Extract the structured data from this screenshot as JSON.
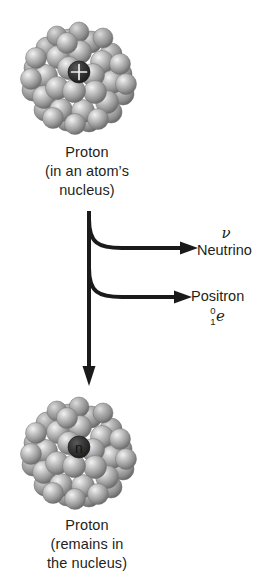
{
  "diagram": {
    "background_color": "#ffffff",
    "ink_color": "#231f20",
    "nucleon_color": "#9a9a9a",
    "marker_color": "#2b2b2b"
  },
  "top_nucleus": {
    "center_marker": "+",
    "marker_name": "plus-charge-marker",
    "nucleon_count": 37
  },
  "top_caption": {
    "line1": "Proton",
    "line2": "(in an atom’s",
    "line3": "nucleus)"
  },
  "bottom_nucleus": {
    "center_marker": "n",
    "marker_name": "neutron-marker",
    "nucleon_count": 37
  },
  "bottom_caption": {
    "line1": "Proton",
    "line2": "(remains in",
    "line3": "the nucleus)"
  },
  "emissions": [
    {
      "symbol": "ν",
      "name": "Neutrino",
      "notation": null
    },
    {
      "symbol": null,
      "name": "Positron",
      "notation": {
        "superscript": "0",
        "subscript": "1",
        "element": "e"
      }
    }
  ]
}
